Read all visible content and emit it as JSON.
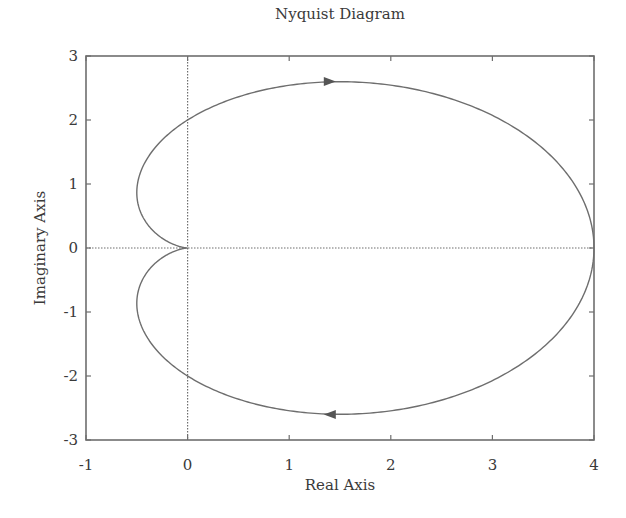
{
  "chart_data": {
    "type": "line",
    "title": "Nyquist Diagram",
    "xlabel": "Real Axis",
    "ylabel": "Imaginary Axis",
    "xlim": [
      -1,
      4
    ],
    "ylim": [
      -3,
      3
    ],
    "xticks": [
      -1,
      0,
      1,
      2,
      3,
      4
    ],
    "yticks": [
      -3,
      -2,
      -1,
      0,
      1,
      2,
      3
    ],
    "xtick_labels": [
      "-1",
      "0",
      "1",
      "2",
      "3",
      "4"
    ],
    "ytick_labels": [
      "-3",
      "-2",
      "-1",
      "0",
      "1",
      "2",
      "3"
    ],
    "grid": false,
    "reference_lines": [
      {
        "orientation": "vertical",
        "value": 0,
        "style": "dotted"
      },
      {
        "orientation": "horizontal",
        "value": 0,
        "style": "dotted"
      }
    ],
    "series": [
      {
        "name": "G(jw) positive frequency",
        "description": "Nyquist contour of 4/(s+1)^2, starts at (4,0), passes (0,-2), min real -0.5, ends at origin",
        "x": [
          4.0,
          3.53,
          2.4,
          1.5,
          0.0,
          -0.5,
          -0.32,
          -0.15,
          0.0
        ],
        "y": [
          0.0,
          -1.25,
          -2.4,
          -2.6,
          -2.0,
          -0.87,
          -0.38,
          -0.1,
          0.0
        ],
        "arrow_at": [
          1.4,
          -2.6
        ],
        "arrow_direction": "left"
      },
      {
        "name": "G(jw) negative frequency (mirror)",
        "x": [
          0.0,
          -0.15,
          -0.32,
          -0.5,
          0.0,
          1.5,
          2.4,
          3.53,
          4.0
        ],
        "y": [
          0.0,
          0.1,
          0.38,
          0.87,
          2.0,
          2.6,
          2.4,
          1.25,
          0.0
        ],
        "arrow_at": [
          1.4,
          2.6
        ],
        "arrow_direction": "right"
      }
    ],
    "line_color": "#6e6e6e",
    "axes_color": "#6e6e6e"
  }
}
